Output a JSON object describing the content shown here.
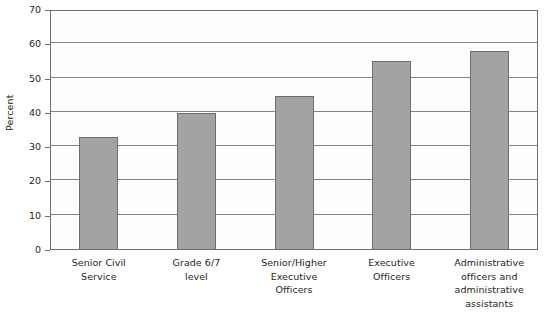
{
  "chart_data": {
    "type": "bar",
    "title": "",
    "xlabel": "",
    "ylabel": "Percent",
    "ylim": [
      0,
      70
    ],
    "ytick_step": 10,
    "yticks": [
      0,
      10,
      20,
      30,
      40,
      50,
      60,
      70
    ],
    "ytick_labels": [
      "0",
      "10",
      "20",
      "30",
      "40",
      "50",
      "60",
      "70"
    ],
    "grid": true,
    "grid_axis": "y",
    "legend": false,
    "categories": [
      "Senior Civil\nService",
      "Grade 6/7\nlevel",
      "Senior/Higher\nExecutive\nOfficers",
      "Executive\nOfficers",
      "Administrative\nofficers and\nadministrative\nassistants"
    ],
    "values": [
      33,
      40,
      45,
      55,
      58
    ],
    "bar_color": "#a3a3a3",
    "bar_edge_color": "#6d6e71",
    "axis_color": "#6d6e71",
    "grid_color": "#808285",
    "background_color": "#ffffff"
  }
}
